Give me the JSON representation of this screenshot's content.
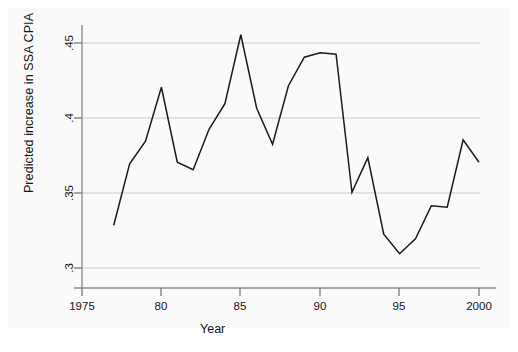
{
  "chart_data": {
    "type": "line",
    "title": "",
    "xlabel": "Year",
    "ylabel": "Predicted increase in SSA CPIA",
    "xlim": [
      1975,
      2000
    ],
    "ylim": [
      0.3,
      0.46
    ],
    "xticks": [
      1975,
      1980,
      1985,
      1990,
      1995,
      2000
    ],
    "xticklabels": [
      "1975",
      "80",
      "85",
      "90",
      "95",
      "2000"
    ],
    "yticks": [
      0.3,
      0.35,
      0.4,
      0.45
    ],
    "yticklabels": [
      ".3",
      ".35",
      ".4",
      ".45"
    ],
    "grid": "horizontal",
    "legend": "none",
    "line_color": "#1a1a1a",
    "background_color": "#fafafa",
    "plot_background_color": "#ffffff",
    "grid_color": "#c8c8c8",
    "x": [
      1977,
      1978,
      1979,
      1980,
      1981,
      1982,
      1983,
      1984,
      1985,
      1986,
      1987,
      1988,
      1989,
      1990,
      1991,
      1992,
      1993,
      1994,
      1995,
      1996,
      1997,
      1998,
      1999,
      2000
    ],
    "values": [
      0.3285,
      0.3695,
      0.3845,
      0.4205,
      0.3705,
      0.3655,
      0.3925,
      0.4095,
      0.4555,
      0.4065,
      0.3825,
      0.4215,
      0.4405,
      0.4435,
      0.4425,
      0.3505,
      0.3735,
      0.3225,
      0.3095,
      0.3195,
      0.3415,
      0.3405,
      0.3855,
      0.3705
    ],
    "series": [
      {
        "name": "Predicted increase in SSA CPIA",
        "values": [
          0.3285,
          0.3695,
          0.3845,
          0.4205,
          0.3705,
          0.3655,
          0.3925,
          0.4095,
          0.4555,
          0.4065,
          0.3825,
          0.4215,
          0.4405,
          0.4435,
          0.4425,
          0.3505,
          0.3735,
          0.3225,
          0.3095,
          0.3195,
          0.3415,
          0.3405,
          0.3855,
          0.3705
        ]
      }
    ]
  }
}
